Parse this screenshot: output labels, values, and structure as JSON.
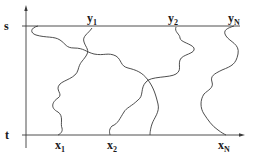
{
  "diagram": {
    "type": "non-intersecting paths / path crossing diagram",
    "axis_labels": {
      "top": "s",
      "bottom": "t"
    },
    "top_points": [
      {
        "base": "y",
        "sub": "1"
      },
      {
        "base": "y",
        "sub": "2"
      },
      {
        "base": "y",
        "sub": "N"
      }
    ],
    "bottom_points": [
      {
        "base": "x",
        "sub": "1"
      },
      {
        "base": "x",
        "sub": "2"
      },
      {
        "base": "x",
        "sub": "N"
      }
    ],
    "stroke_color": "#3a3a3a"
  }
}
